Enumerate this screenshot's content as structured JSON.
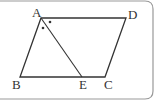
{
  "diagram": {
    "type": "parallelogram",
    "points": {
      "A": {
        "label": "A"
      },
      "B": {
        "label": "B"
      },
      "C": {
        "label": "C"
      },
      "D": {
        "label": "D"
      },
      "E": {
        "label": "E"
      }
    },
    "segments": [
      "AB",
      "BC",
      "CD",
      "DA",
      "AE"
    ],
    "angle_marks": "angle BAE = angle EAD (marked with dots)",
    "colors": {
      "line": "#333333",
      "frame": "#999999"
    }
  }
}
